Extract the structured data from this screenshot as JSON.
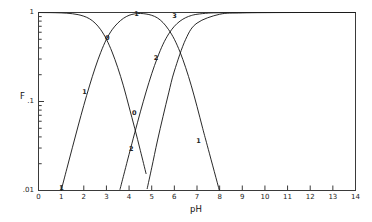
{
  "chart_data": {
    "type": "line",
    "title": "",
    "xlabel": "pH",
    "ylabel": "F",
    "xlim": [
      0,
      14
    ],
    "ylim": [
      0.01,
      1
    ],
    "yscale": "log",
    "xscale": "linear",
    "grid": false,
    "legend": "none",
    "frame": true,
    "x_ticks": [
      "0",
      "1",
      "2",
      "3",
      "4",
      "5",
      "6",
      "7",
      "8",
      "9",
      "10",
      "11",
      "12",
      "13",
      "14"
    ],
    "y_ticks": [
      "1",
      ".1",
      ".01"
    ],
    "y_tick_values": [
      1,
      0.1,
      0.01
    ],
    "y_minor_ticks_per_decade": 9,
    "series": [
      {
        "name": "0",
        "label": "0",
        "label_points": [
          {
            "x": 3.02,
            "y": 0.5
          },
          {
            "x": 4.22,
            "y": 0.072
          }
        ],
        "comment": "H3A fully protonated fraction: alpha0",
        "x": [
          0.0,
          0.25,
          0.5,
          0.75,
          1.0,
          1.25,
          1.5,
          1.75,
          2.0,
          2.25,
          2.5,
          2.75,
          3.0,
          3.25,
          3.5,
          3.75,
          4.0,
          4.25,
          4.5,
          4.75,
          5.0
        ],
        "y": [
          0.999,
          0.998,
          0.997,
          0.994,
          0.99,
          0.982,
          0.969,
          0.946,
          0.909,
          0.851,
          0.76,
          0.64,
          0.5,
          0.36,
          0.24,
          0.15,
          0.087,
          0.05,
          0.028,
          0.0155,
          0.0085
        ]
      },
      {
        "name": "1",
        "label": "1",
        "label_points": [
          {
            "x": 1.0,
            "y": 0.0105
          },
          {
            "x": 2.02,
            "y": 0.125
          },
          {
            "x": 4.32,
            "y": 0.93
          },
          {
            "x": 7.05,
            "y": 0.035
          }
        ],
        "comment": "H2A- fraction: alpha1, peaks near pH 4.3",
        "x": [
          0.75,
          1.0,
          1.25,
          1.5,
          1.75,
          2.0,
          2.25,
          2.5,
          2.75,
          3.0,
          3.25,
          3.5,
          3.75,
          4.0,
          4.25,
          4.5,
          4.75,
          5.0,
          5.25,
          5.5,
          5.75,
          6.0,
          6.25,
          6.5,
          6.75,
          7.0,
          7.25,
          7.5
        ],
        "y": [
          0.0056,
          0.0099,
          0.0175,
          0.0306,
          0.0531,
          0.0905,
          0.1495,
          0.238,
          0.357,
          0.5,
          0.64,
          0.76,
          0.86,
          0.93,
          0.965,
          0.975,
          0.962,
          0.93,
          0.87,
          0.77,
          0.64,
          0.5,
          0.36,
          0.24,
          0.15,
          0.088,
          0.05,
          0.029
        ]
      },
      {
        "name": "2",
        "label": "2",
        "label_points": [
          {
            "x": 4.08,
            "y": 0.0285
          },
          {
            "x": 5.18,
            "y": 0.3
          }
        ],
        "comment": "HA2- fraction: alpha2, rises from pH ~3.6",
        "x": [
          3.6,
          3.8,
          4.0,
          4.25,
          4.5,
          4.75,
          5.0,
          5.25,
          5.5,
          5.75,
          6.0,
          6.25,
          6.5,
          6.75,
          7.0,
          7.5,
          8.0,
          9.0,
          10.0,
          12.0,
          14.0
        ],
        "y": [
          0.0103,
          0.0162,
          0.0255,
          0.0445,
          0.0765,
          0.128,
          0.205,
          0.31,
          0.44,
          0.575,
          0.7,
          0.8,
          0.875,
          0.925,
          0.955,
          0.985,
          0.994,
          0.999,
          0.9995,
          0.9999,
          0.9999
        ]
      },
      {
        "name": "3",
        "label": "3",
        "label_points": [
          {
            "x": 6.0,
            "y": 0.9
          }
        ],
        "comment": "A3- fraction: alpha3, approaches 1 at high pH",
        "x": [
          4.8,
          5.0,
          5.25,
          5.5,
          5.75,
          6.0,
          6.5,
          7.0,
          8.0,
          9.0,
          11.0,
          14.0
        ],
        "y": [
          0.0105,
          0.018,
          0.036,
          0.068,
          0.125,
          0.22,
          0.5,
          0.76,
          0.955,
          0.99,
          0.999,
          0.9999
        ]
      }
    ],
    "crossovers": [
      {
        "x": 3.0,
        "y": 0.5,
        "between": [
          "0",
          "1"
        ]
      },
      {
        "x": 4.3,
        "y": 0.93,
        "between": [
          "1",
          "2"
        ]
      },
      {
        "x": 4.35,
        "y": 0.045,
        "between": [
          "0",
          "2"
        ]
      },
      {
        "x": 5.6,
        "y": 0.7,
        "between": [
          "2",
          "3"
        ]
      }
    ]
  }
}
